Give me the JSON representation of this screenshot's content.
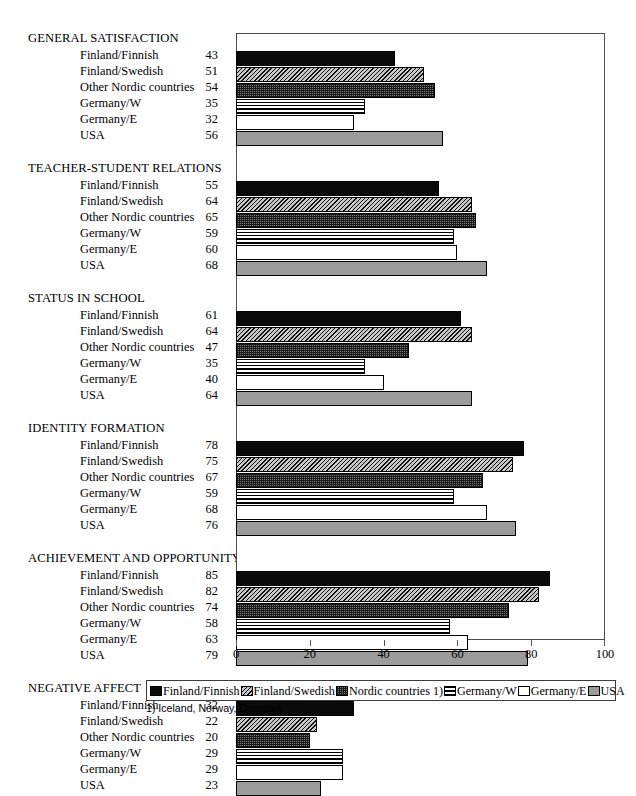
{
  "figure": {
    "faint_top_title": "",
    "footnote": "1) Iceland, Norway, Denmark"
  },
  "axis": {
    "ticks": [
      0,
      20,
      40,
      60,
      80,
      100
    ]
  },
  "legend": {
    "items": [
      {
        "label": "Finland/Finnish",
        "pattern": "solid-black"
      },
      {
        "label": "Finland/Swedish",
        "pattern": "diagonal-hatch"
      },
      {
        "label": "Nordic countries 1)",
        "pattern": "checker-dot"
      },
      {
        "label": "Germany/W",
        "pattern": "horizontal-lines"
      },
      {
        "label": "Germany/E",
        "pattern": "white-empty"
      },
      {
        "label": "USA",
        "pattern": "solid-gray"
      }
    ]
  },
  "chart_data": {
    "type": "bar",
    "orientation": "horizontal",
    "title": "",
    "xlabel": "",
    "ylabel": "",
    "xlim": [
      0,
      100
    ],
    "grid": false,
    "legend_position": "bottom",
    "footnote": "1) Iceland, Norway, Denmark",
    "categories": [
      "GENERAL SATISFACTION",
      "TEACHER-STUDENT RELATIONS",
      "STATUS IN SCHOOL",
      "IDENTITY FORMATION",
      "ACHIEVEMENT AND OPPORTUNITY",
      "NEGATIVE AFFECT"
    ],
    "series_names": [
      "Finland/Finnish",
      "Finland/Swedish",
      "Other Nordic countries",
      "Germany/W",
      "Germany/E",
      "USA"
    ],
    "series": [
      {
        "name": "Finland/Finnish",
        "values": [
          43,
          55,
          61,
          78,
          85,
          32
        ]
      },
      {
        "name": "Finland/Swedish",
        "values": [
          51,
          64,
          64,
          75,
          82,
          22
        ]
      },
      {
        "name": "Other Nordic countries",
        "values": [
          54,
          65,
          47,
          67,
          74,
          20
        ]
      },
      {
        "name": "Germany/W",
        "values": [
          35,
          59,
          35,
          59,
          58,
          29
        ]
      },
      {
        "name": "Germany/E",
        "values": [
          32,
          60,
          40,
          68,
          63,
          29
        ]
      },
      {
        "name": "USA",
        "values": [
          56,
          68,
          64,
          76,
          79,
          23
        ]
      }
    ],
    "groups": [
      {
        "title": "GENERAL SATISFACTION",
        "rows": [
          {
            "label": "Finland/Finnish",
            "value": 43
          },
          {
            "label": "Finland/Swedish",
            "value": 51
          },
          {
            "label": "Other Nordic countries",
            "value": 54
          },
          {
            "label": "Germany/W",
            "value": 35
          },
          {
            "label": "Germany/E",
            "value": 32
          },
          {
            "label": "USA",
            "value": 56
          }
        ]
      },
      {
        "title": "TEACHER-STUDENT RELATIONS",
        "rows": [
          {
            "label": "Finland/Finnish",
            "value": 55
          },
          {
            "label": "Finland/Swedish",
            "value": 64
          },
          {
            "label": "Other Nordic countries",
            "value": 65
          },
          {
            "label": "Germany/W",
            "value": 59
          },
          {
            "label": "Germany/E",
            "value": 60
          },
          {
            "label": "USA",
            "value": 68
          }
        ]
      },
      {
        "title": "STATUS IN SCHOOL",
        "rows": [
          {
            "label": "Finland/Finnish",
            "value": 61
          },
          {
            "label": "Finland/Swedish",
            "value": 64
          },
          {
            "label": "Other Nordic countries",
            "value": 47
          },
          {
            "label": "Germany/W",
            "value": 35
          },
          {
            "label": "Germany/E",
            "value": 40
          },
          {
            "label": "USA",
            "value": 64
          }
        ]
      },
      {
        "title": "IDENTITY FORMATION",
        "rows": [
          {
            "label": "Finland/Finnish",
            "value": 78
          },
          {
            "label": "Finland/Swedish",
            "value": 75
          },
          {
            "label": "Other Nordic countries",
            "value": 67
          },
          {
            "label": "Germany/W",
            "value": 59
          },
          {
            "label": "Germany/E",
            "value": 68
          },
          {
            "label": "USA",
            "value": 76
          }
        ]
      },
      {
        "title": "ACHIEVEMENT AND OPPORTUNITY",
        "rows": [
          {
            "label": "Finland/Finnish",
            "value": 85
          },
          {
            "label": "Finland/Swedish",
            "value": 82
          },
          {
            "label": "Other Nordic countries",
            "value": 74
          },
          {
            "label": "Germany/W",
            "value": 58
          },
          {
            "label": "Germany/E",
            "value": 63
          },
          {
            "label": "USA",
            "value": 79
          }
        ]
      },
      {
        "title": "NEGATIVE AFFECT",
        "rows": [
          {
            "label": "Finland/Finnish",
            "value": 32
          },
          {
            "label": "Finland/Swedish",
            "value": 22
          },
          {
            "label": "Other Nordic countries",
            "value": 20
          },
          {
            "label": "Germany/W",
            "value": 29
          },
          {
            "label": "Germany/E",
            "value": 29
          },
          {
            "label": "USA",
            "value": 23
          }
        ]
      }
    ]
  }
}
